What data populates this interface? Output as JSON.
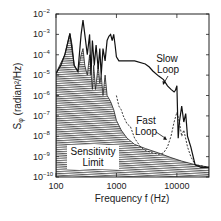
{
  "chart_data": {
    "type": "line",
    "title": "",
    "xlabel": "Frequency  f (Hz)",
    "ylabel": "Sφ (radian²/Hz)",
    "xscale": "log",
    "yscale": "log",
    "xlim": [
      100,
      34000
    ],
    "ylim": [
      1e-10,
      0.01
    ],
    "x_ticks": [
      {
        "value": 100,
        "label": "100"
      },
      {
        "value": 1000,
        "label": "1000"
      },
      {
        "value": 10000,
        "label": "10000"
      }
    ],
    "y_ticks": [
      {
        "exp": -2,
        "label": "10",
        "sup": "−2"
      },
      {
        "exp": -3,
        "label": "10",
        "sup": "−3"
      },
      {
        "exp": -4,
        "label": "10",
        "sup": "−4"
      },
      {
        "exp": -5,
        "label": "10",
        "sup": "−5"
      },
      {
        "exp": -6,
        "label": "10",
        "sup": "−6"
      },
      {
        "exp": -7,
        "label": "10",
        "sup": "−7"
      },
      {
        "exp": -8,
        "label": "10",
        "sup": "−8"
      },
      {
        "exp": -9,
        "label": "10",
        "sup": "−9"
      },
      {
        "exp": -10,
        "label": "10",
        "sup": "−10"
      }
    ],
    "grid": false,
    "legend": null,
    "series": [
      {
        "name": "Sensitivity Limit",
        "style": "hatched-area",
        "x": [
          100,
          115,
          140,
          170,
          185,
          200,
          230,
          260,
          280,
          300,
          330,
          360,
          400,
          420,
          450,
          500,
          530,
          560,
          600,
          650,
          700,
          800,
          900,
          1000,
          1200,
          1500,
          2000,
          3000,
          5000,
          8000,
          12000,
          20000,
          34000
        ],
        "y": [
          1.2e-05,
          3e-05,
          0.0001,
          0.0011,
          0.0003,
          3e-05,
          1.5e-05,
          0.0001,
          0.0002,
          3e-05,
          1e-05,
          0.0001,
          2e-06,
          3e-05,
          2e-06,
          3e-05,
          4e-06,
          1e-05,
          1e-06,
          1e-05,
          1e-06,
          5e-07,
          2e-07,
          6e-08,
          2e-08,
          8e-09,
          4e-09,
          2.5e-09,
          1.5e-09,
          9e-10,
          6e-10,
          4e-10,
          3e-10
        ]
      },
      {
        "name": "Slow Loop",
        "style": "solid",
        "x": [
          100,
          120,
          140,
          170,
          200,
          230,
          260,
          280,
          300,
          330,
          360,
          380,
          400,
          430,
          460,
          500,
          530,
          560,
          600,
          650,
          700,
          750,
          800,
          850,
          900,
          950,
          1000,
          1100,
          1500,
          2000,
          3000,
          3500,
          4000,
          5000,
          6000,
          7000,
          8000,
          9000,
          9500,
          10000,
          10500,
          11000,
          12000,
          13000,
          14000,
          15000,
          17000,
          20000,
          25000,
          34000
        ],
        "y": [
          1.2e-05,
          3e-05,
          0.0001,
          0.0011,
          3e-05,
          1.5e-05,
          0.001,
          0.005,
          0.001,
          0.0001,
          0.001,
          1e-05,
          0.0005,
          3e-05,
          0.0003,
          2e-05,
          0.0002,
          1e-05,
          0.0002,
          5e-05,
          0.0005,
          0.0008,
          0.001,
          0.0005,
          0.001,
          0.0003,
          8e-05,
          5e-05,
          5e-05,
          5e-05,
          3.5e-05,
          2.5e-05,
          1.6e-05,
          9e-06,
          6e-06,
          3e-06,
          2e-06,
          1.5e-06,
          1.8e-06,
          3e-06,
          8e-09,
          5e-08,
          3e-07,
          5e-08,
          1.3e-07,
          1e-08,
          3e-09,
          4e-10,
          3e-10,
          3e-10
        ]
      },
      {
        "name": "Fast Loop",
        "style": "dashed",
        "x": [
          1000,
          1100,
          1200,
          1300,
          1500,
          1700,
          2000,
          2500,
          3000,
          4000,
          5000,
          6000,
          7000,
          8000,
          9000,
          10000,
          11000,
          12000,
          13000,
          15000,
          17000,
          20000,
          34000
        ],
        "y": [
          1e-06,
          3e-07,
          2e-07,
          1e-07,
          4e-08,
          3e-08,
          8e-09,
          3e-09,
          2e-09,
          1.5e-09,
          1.3e-09,
          1.5e-09,
          3e-09,
          1e-08,
          5e-08,
          1.5e-07,
          5e-08,
          1e-08,
          2e-08,
          3e-09,
          1e-09,
          4e-10,
          3e-10
        ]
      }
    ],
    "annotations": [
      {
        "text_lines": [
          "Slow",
          "Loop"
        ],
        "target_series": "Slow Loop",
        "arrow": true
      },
      {
        "text_lines": [
          "Fast",
          "Loop"
        ],
        "target_series": "Fast Loop",
        "arrow": true
      },
      {
        "text_lines": [
          "Sensitivity",
          "Limit"
        ],
        "target_series": "Sensitivity Limit",
        "arrow": false
      }
    ]
  },
  "labels": {
    "xlabel": "Frequency  f (Hz)",
    "ylabel_main": "S",
    "ylabel_sub": "φ",
    "ylabel_units": " (radian²/Hz)",
    "slow1": "Slow",
    "slow2": "Loop",
    "fast1": "Fast",
    "fast2": "Loop",
    "sens1": "Sensitivity",
    "sens2": "Limit"
  }
}
